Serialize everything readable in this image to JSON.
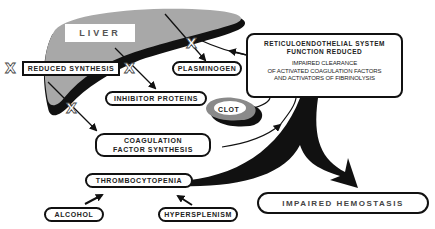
{
  "diagram": {
    "organ_label": "LIVER",
    "reduced_synthesis": "REDUCED SYNTHESIS",
    "plasminogen": "PLASMINOGEN",
    "inhibitor_proteins": "INHIBITOR PROTEINS",
    "clot": "CLOT",
    "coagulation_factor_synthesis": "COAGULATION FACTOR SYNTHESIS",
    "reticuloendothelial": {
      "title_line1": "RETICULOENDOTHELIAL SYSTEM",
      "title_line2": "FUNCTION REDUCED",
      "body_line1": "IMPAIRED CLEARANCE",
      "body_line2": "OF ACTIVATED COAGULATION FACTORS",
      "body_line3": "AND ACTIVATORS OF FIBRINOLYSIS"
    },
    "thrombocytopenia": "THROMBOCYTOPENIA",
    "alcohol": "ALCOHOL",
    "hypersplenism": "HYPERSPLENISM",
    "impaired_hemostasis": "IMPAIRED   HEMOSTASIS",
    "block_mark": "X"
  },
  "colors": {
    "liver_fill": "#a8a8a8",
    "liver_edge": "#111111",
    "clot_ring": "#8a8a8a",
    "clot_shadow": "#111111",
    "line": "#111111"
  }
}
